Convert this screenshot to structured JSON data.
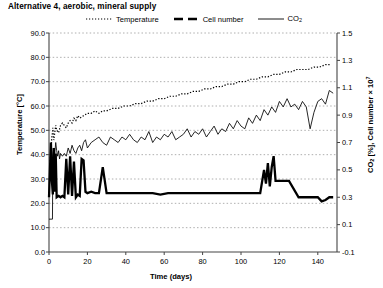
{
  "chart_data": {
    "type": "line",
    "title": "Alternative 4, aerobic, mineral supply",
    "xlabel": "Time (days)",
    "ylabel_left": "Temperature [°C]",
    "ylabel_right": "CO2 [%], Cell number × 10^7",
    "xlim": [
      0,
      150
    ],
    "ylim_left": [
      0.0,
      90.0
    ],
    "ylim_right": [
      -0.1,
      1.5
    ],
    "xticks": [
      0,
      20,
      40,
      60,
      80,
      100,
      120,
      140
    ],
    "yticks_left": [
      "0.0",
      "10.0",
      "20.0",
      "30.0",
      "40.0",
      "50.0",
      "60.0",
      "70.0",
      "80.0",
      "90.0"
    ],
    "yticks_right": [
      "-0.1",
      "0.1",
      "0.3",
      "0.5",
      "0.7",
      "0.9",
      "1.1",
      "1.3",
      "1.5"
    ],
    "grid": "horizontal-dotted",
    "legend_position": "top-center",
    "legend": [
      {
        "label": "Temperature",
        "style": "dotted",
        "axis": "left"
      },
      {
        "label": "Cell number",
        "style": "thick-dashed",
        "axis": "right"
      },
      {
        "label": "CO2",
        "style": "thin-solid",
        "axis": "right"
      }
    ],
    "series": [
      {
        "name": "Temperature",
        "axis": "left",
        "unit": "°C",
        "style": "dotted",
        "x": [
          0.5,
          1,
          1.5,
          2,
          2.5,
          3,
          3.5,
          4,
          5,
          6,
          7,
          8,
          9,
          10,
          11,
          12,
          13,
          14,
          15,
          16,
          18,
          20,
          22,
          24,
          26,
          28,
          30,
          33,
          36,
          39,
          42,
          45,
          48,
          51,
          54,
          57,
          60,
          63,
          66,
          69,
          72,
          75,
          78,
          81,
          84,
          87,
          90,
          93,
          96,
          99,
          102,
          105,
          108,
          111,
          114,
          117,
          120,
          123,
          126,
          129,
          132,
          135,
          138,
          141,
          144,
          147
        ],
        "y": [
          36,
          42,
          47,
          51,
          46,
          49,
          52,
          50,
          49,
          52,
          53,
          52,
          51,
          53,
          54,
          53,
          55,
          54,
          56,
          55,
          56,
          57,
          57,
          58,
          57,
          58,
          58,
          59,
          59,
          60,
          60,
          61,
          61,
          62,
          62,
          63,
          63,
          64,
          64,
          65,
          65,
          66,
          66,
          67,
          67,
          68,
          68,
          69,
          69,
          70,
          70,
          71,
          71,
          72,
          72,
          73,
          73,
          74,
          74,
          75,
          75,
          75,
          76,
          76,
          77,
          77
        ]
      },
      {
        "name": "Cell number",
        "axis": "right",
        "unit": "×10^7",
        "style": "thick-dashed",
        "x": [
          0,
          1,
          1.5,
          2,
          2.5,
          3,
          3.5,
          4,
          5,
          6,
          7,
          8,
          9,
          10,
          11,
          12,
          13,
          14,
          15,
          16,
          17,
          18,
          19,
          20,
          22,
          24,
          26,
          28,
          30,
          34,
          38,
          42,
          46,
          50,
          54,
          58,
          62,
          66,
          70,
          74,
          78,
          82,
          86,
          90,
          94,
          98,
          102,
          106,
          110,
          112,
          113,
          114,
          115,
          116,
          117,
          118,
          119,
          120,
          125,
          130,
          135,
          140,
          142,
          144,
          146,
          148
        ],
        "y": [
          0.3,
          0.7,
          0.42,
          0.32,
          0.66,
          0.34,
          0.62,
          0.3,
          0.31,
          0.3,
          0.31,
          0.3,
          0.58,
          0.32,
          0.6,
          0.31,
          0.56,
          0.3,
          0.32,
          0.31,
          0.58,
          0.57,
          0.34,
          0.33,
          0.34,
          0.33,
          0.33,
          0.52,
          0.33,
          0.33,
          0.33,
          0.33,
          0.33,
          0.33,
          0.33,
          0.32,
          0.33,
          0.33,
          0.33,
          0.33,
          0.33,
          0.33,
          0.33,
          0.33,
          0.33,
          0.33,
          0.33,
          0.33,
          0.33,
          0.5,
          0.4,
          0.55,
          0.38,
          0.52,
          0.6,
          0.42,
          0.42,
          0.42,
          0.42,
          0.3,
          0.3,
          0.3,
          0.27,
          0.28,
          0.3,
          0.3
        ]
      },
      {
        "name": "CO2",
        "axis": "right",
        "unit": "%",
        "style": "thin-solid",
        "x": [
          0,
          1.8,
          2,
          2.5,
          3,
          3.5,
          4,
          4.5,
          5,
          5.5,
          6,
          7,
          8,
          9,
          10,
          11,
          12,
          13,
          14,
          15,
          16,
          17,
          18,
          19,
          20,
          22,
          24,
          26,
          28,
          30,
          32,
          34,
          36,
          38,
          40,
          42,
          44,
          46,
          48,
          50,
          52,
          54,
          56,
          58,
          60,
          62,
          64,
          66,
          68,
          70,
          72,
          74,
          76,
          78,
          80,
          82,
          84,
          86,
          88,
          90,
          92,
          94,
          96,
          98,
          100,
          102,
          104,
          106,
          108,
          110,
          112,
          114,
          116,
          118,
          120,
          122,
          124,
          126,
          128,
          130,
          132,
          134,
          136,
          138,
          140,
          142,
          144,
          146,
          148
        ],
        "y": [
          0.14,
          0.14,
          0.6,
          0.66,
          0.62,
          0.7,
          0.64,
          0.6,
          0.64,
          0.58,
          0.62,
          0.6,
          0.62,
          0.6,
          0.66,
          0.62,
          0.68,
          0.64,
          0.62,
          0.66,
          0.68,
          0.64,
          0.7,
          0.72,
          0.66,
          0.7,
          0.72,
          0.74,
          0.7,
          0.68,
          0.74,
          0.72,
          0.7,
          0.74,
          0.72,
          0.76,
          0.72,
          0.7,
          0.74,
          0.72,
          0.78,
          0.7,
          0.74,
          0.72,
          0.76,
          0.74,
          0.78,
          0.72,
          0.74,
          0.76,
          0.8,
          0.74,
          0.78,
          0.76,
          0.8,
          0.74,
          0.78,
          0.82,
          0.76,
          0.8,
          0.78,
          0.84,
          0.8,
          0.86,
          0.82,
          0.8,
          0.88,
          0.84,
          0.9,
          0.86,
          0.94,
          0.9,
          0.96,
          0.92,
          1.0,
          0.96,
          1.02,
          0.96,
          0.98,
          0.94,
          1.0,
          0.96,
          0.8,
          0.92,
          1.0,
          1.02,
          0.98,
          1.08,
          1.06
        ]
      }
    ]
  }
}
